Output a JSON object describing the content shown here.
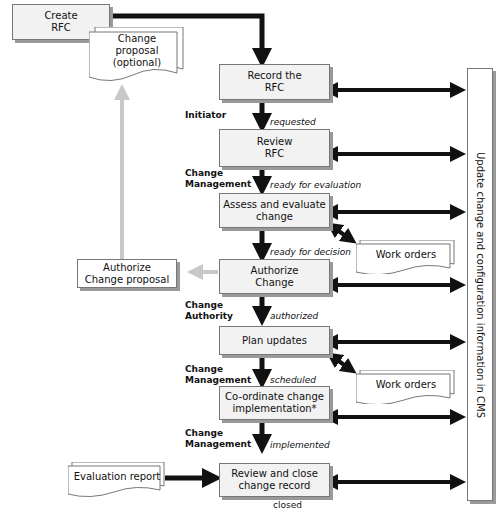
{
  "steps": {
    "create": "Create\nRFC",
    "record": "Record the\nRFC",
    "review": "Review\nRFC",
    "assess": "Assess and evaluate\nchange",
    "authorize": "Authorize\nChange",
    "plan": "Plan updates",
    "coordinate": "Co-ordinate change\nimplementation*",
    "close": "Review and close\nchange record",
    "authorize_proposal": "Authorize\nChange proposal"
  },
  "documents": {
    "change_proposal": "Change\nproposal\n(optional)",
    "work_orders_1": "Work orders",
    "work_orders_2": "Work orders",
    "evaluation_report": "Evaluation report"
  },
  "roles": {
    "initiator": "Initiator",
    "cm1": "Change\nManagement",
    "authority": "Change\nAuthority",
    "cm2": "Change\nManagement",
    "cm3": "Change\nManagement"
  },
  "states": {
    "requested": "requested",
    "ready_eval": "ready for evaluation",
    "ready_decision": "ready for decision",
    "authorized": "authorized",
    "scheduled": "scheduled",
    "implemented": "implemented",
    "closed": "closed"
  },
  "cms_label": "Update change and configuration information in CMS",
  "colors": {
    "arrow": "#111111",
    "optional_arrow": "#c8c8c8",
    "box_fill": "#f2f2f2",
    "shadow": "#9a9a9a"
  }
}
